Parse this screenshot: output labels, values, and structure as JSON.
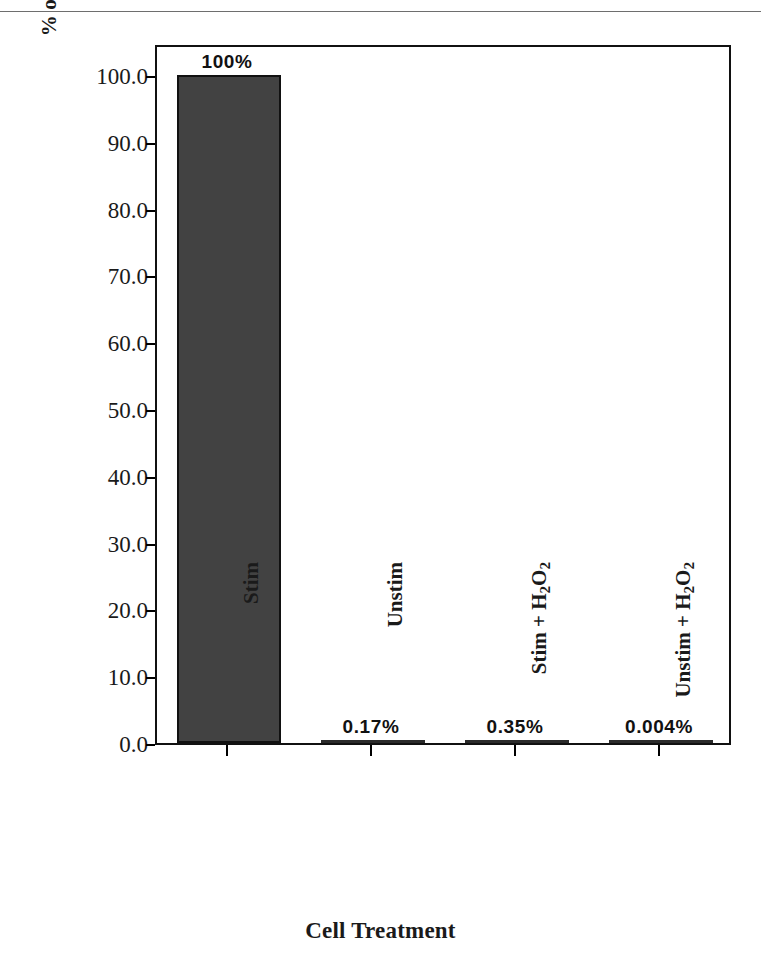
{
  "chart_data": {
    "type": "bar",
    "title": "",
    "xlabel": "Cell Treatment",
    "ylabel": "% of NF-AT Activity in Stimulated pNF-AT3 Cells",
    "ylabel_parts": {
      "before_sub": "% of NF-AT Activity in Stimulated pNF-AT",
      "sub": "3",
      "after_sub": " Cells"
    },
    "categories": [
      "Stim",
      "Unstim",
      "Stim + H2O2",
      "Unstim + H2O2"
    ],
    "category_parts": [
      {
        "before_sub": "Stim",
        "sub": "",
        "mid": "",
        "sub2": "",
        "after": ""
      },
      {
        "before_sub": "Unstim",
        "sub": "",
        "mid": "",
        "sub2": "",
        "after": ""
      },
      {
        "before_sub": "Stim + H",
        "sub": "2",
        "mid": "O",
        "sub2": "2",
        "after": ""
      },
      {
        "before_sub": "Unstim + H",
        "sub": "2",
        "mid": "O",
        "sub2": "2",
        "after": ""
      }
    ],
    "values": [
      100,
      0.17,
      0.35,
      0.004
    ],
    "value_labels": [
      "100%",
      "0.17%",
      "0.35%",
      "0.004%"
    ],
    "ylim": [
      0,
      100
    ],
    "yticks": [
      0,
      10,
      20,
      30,
      40,
      50,
      60,
      70,
      80,
      90,
      100
    ],
    "ytick_labels": [
      "0.0",
      "10.0",
      "20.0",
      "30.0",
      "40.0",
      "50.0",
      "60.0",
      "70.0",
      "80.0",
      "90.0",
      "100.0"
    ],
    "grid": false,
    "legend": null,
    "bar_color": "#424242",
    "bar_edge_color": "#111111",
    "axis_color": "#111111",
    "background_color": "#ffffff"
  }
}
